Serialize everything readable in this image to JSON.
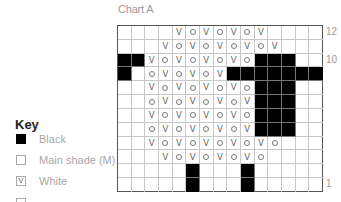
{
  "chart": {
    "title": "Chart A",
    "columns": 15,
    "rows": 12,
    "row_labels": [
      {
        "row": 12,
        "label": "12"
      },
      {
        "row": 10,
        "label": "10"
      },
      {
        "row": 1,
        "label": "1"
      }
    ],
    "legend_codes": {
      "B": "Black",
      "M": "Main shade (M)",
      "V": "White (V)",
      "O": "circle symbol"
    },
    "grid": [
      [
        "M",
        "M",
        "M",
        "M",
        "V",
        "O",
        "V",
        "O",
        "V",
        "O",
        "V",
        "M",
        "M",
        "M",
        "M"
      ],
      [
        "M",
        "M",
        "M",
        "V",
        "O",
        "V",
        "O",
        "V",
        "O",
        "V",
        "O",
        "V",
        "M",
        "M",
        "M"
      ],
      [
        "B",
        "B",
        "V",
        "O",
        "V",
        "O",
        "V",
        "O",
        "V",
        "O",
        "B",
        "B",
        "B",
        "M",
        "M"
      ],
      [
        "B",
        "M",
        "O",
        "V",
        "O",
        "V",
        "O",
        "V",
        "B",
        "B",
        "B",
        "B",
        "B",
        "B",
        "B"
      ],
      [
        "M",
        "M",
        "V",
        "O",
        "V",
        "O",
        "V",
        "O",
        "V",
        "O",
        "B",
        "B",
        "B",
        "M",
        "M"
      ],
      [
        "M",
        "M",
        "O",
        "V",
        "O",
        "V",
        "O",
        "V",
        "O",
        "V",
        "B",
        "B",
        "B",
        "M",
        "M"
      ],
      [
        "M",
        "M",
        "V",
        "O",
        "V",
        "O",
        "V",
        "O",
        "V",
        "O",
        "B",
        "B",
        "B",
        "M",
        "M"
      ],
      [
        "M",
        "M",
        "O",
        "V",
        "O",
        "V",
        "O",
        "V",
        "O",
        "V",
        "B",
        "B",
        "B",
        "M",
        "M"
      ],
      [
        "M",
        "M",
        "V",
        "O",
        "V",
        "O",
        "V",
        "O",
        "V",
        "O",
        "V",
        "O",
        "M",
        "M",
        "M"
      ],
      [
        "M",
        "M",
        "M",
        "V",
        "O",
        "V",
        "O",
        "V",
        "O",
        "V",
        "O",
        "M",
        "M",
        "M",
        "M"
      ],
      [
        "M",
        "M",
        "M",
        "M",
        "M",
        "B",
        "M",
        "M",
        "M",
        "B",
        "M",
        "M",
        "M",
        "M",
        "M"
      ],
      [
        "M",
        "M",
        "M",
        "M",
        "M",
        "B",
        "M",
        "M",
        "M",
        "B",
        "M",
        "M",
        "M",
        "M",
        "M"
      ]
    ]
  },
  "key": {
    "title": "Key",
    "items": [
      {
        "swatch": "black",
        "symbol": "",
        "label": "Black"
      },
      {
        "swatch": "main",
        "symbol": "",
        "label": "Main shade (M)"
      },
      {
        "swatch": "white",
        "symbol": "V",
        "label": "White"
      }
    ]
  },
  "colors": {
    "black": "#000000",
    "grid_line": "#c8c8c8",
    "label_gray": "#9a9a9a"
  }
}
